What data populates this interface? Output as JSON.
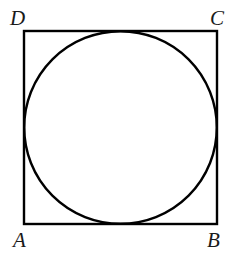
{
  "figure": {
    "background_color": "#ffffff",
    "stroke_color": "#000000",
    "label_color": "#1a1a1a",
    "square": {
      "name": "square-ABCD",
      "x": 24,
      "y": 31,
      "width": 193,
      "height": 193,
      "stroke_width": 2.4,
      "fill": "none"
    },
    "circle": {
      "name": "inscribed-circle",
      "cx": 120.5,
      "cy": 127.5,
      "r": 96.3,
      "stroke_width": 2.4,
      "fill": "none"
    },
    "labels": [
      {
        "id": "A",
        "text": "A",
        "corner": "bottom-left",
        "x": 13,
        "y": 230
      },
      {
        "id": "B",
        "text": "B",
        "corner": "bottom-right",
        "x": 207,
        "y": 230
      },
      {
        "id": "C",
        "text": "C",
        "corner": "top-right",
        "x": 210,
        "y": 8
      },
      {
        "id": "D",
        "text": "D",
        "corner": "top-left",
        "x": 10,
        "y": 8
      }
    ]
  }
}
